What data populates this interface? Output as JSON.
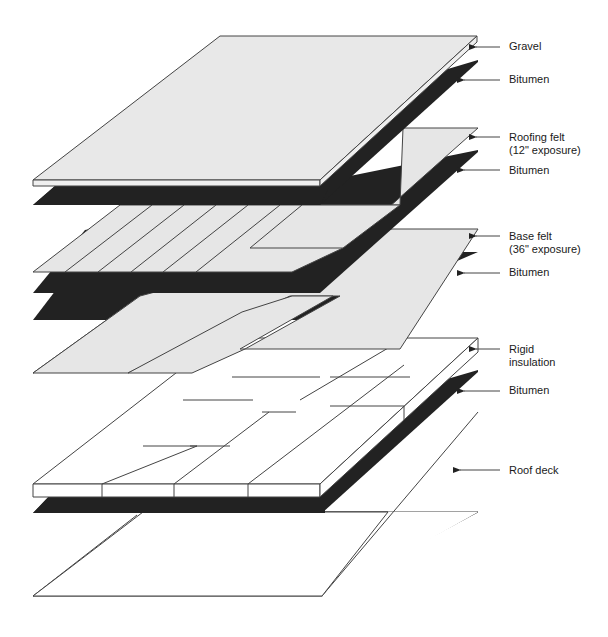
{
  "diagram": {
    "colors": {
      "felt": "#e6e6e6",
      "bitumen": "#222222",
      "insulation": "#ffffff",
      "deck": "#ffffff",
      "stroke": "#444444"
    },
    "layers": [
      {
        "id": "gravel",
        "label": "Gravel"
      },
      {
        "id": "bitumen-1",
        "label": "Bitumen"
      },
      {
        "id": "roofing-felt",
        "label": "Roofing felt\n(12\" exposure)"
      },
      {
        "id": "bitumen-2",
        "label": "Bitumen"
      },
      {
        "id": "base-felt",
        "label": "Base felt\n(36\" exposure)"
      },
      {
        "id": "bitumen-3",
        "label": "Bitumen"
      },
      {
        "id": "rigid-insulation",
        "label": "Rigid\ninsulation"
      },
      {
        "id": "bitumen-4",
        "label": "Bitumen"
      },
      {
        "id": "roof-deck",
        "label": "Roof deck"
      }
    ]
  }
}
